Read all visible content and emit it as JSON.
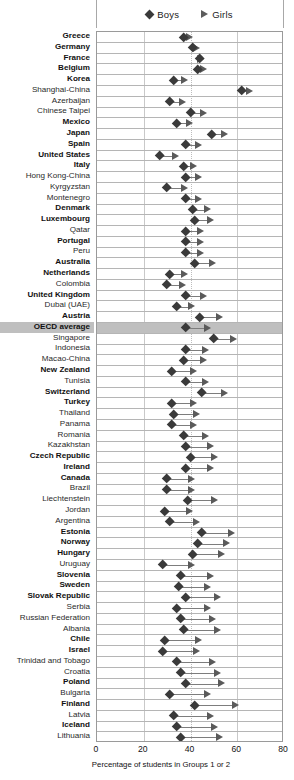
{
  "legend": {
    "boys": {
      "label": "Boys",
      "marker": "diamond-icon",
      "color": "#3a3a3a"
    },
    "girls": {
      "label": "Girls",
      "marker": "triangle-right-icon",
      "color": "#5a5a5a"
    }
  },
  "axis": {
    "xlabel": "Percentage of students in Groups 1 or 2",
    "ticks": [
      "0",
      "20",
      "40",
      "60",
      "80"
    ],
    "min": 0,
    "max": 80
  },
  "chart_data": {
    "type": "scatter",
    "title": "",
    "subtitle": "",
    "xlabel": "Percentage of students in Groups 1 or 2",
    "ylabel": "",
    "xlim": [
      0,
      80
    ],
    "grid": true,
    "legend_position": "top",
    "series": [
      {
        "name": "Boys",
        "marker": "diamond",
        "color": "#3a3a3a"
      },
      {
        "name": "Girls",
        "marker": "triangle-right",
        "color": "#5a5a5a"
      }
    ],
    "categories": [
      "Greece",
      "Germany",
      "France",
      "Belgium",
      "Korea",
      "Shanghai-China",
      "Azerbaijan",
      "Chinese Taipei",
      "Mexico",
      "Japan",
      "Spain",
      "United States",
      "Italy",
      "Hong Kong-China",
      "Kyrgyzstan",
      "Montenegro",
      "Denmark",
      "Luxembourg",
      "Qatar",
      "Portugal",
      "Peru",
      "Australia",
      "Netherlands",
      "Colombia",
      "United Kingdom",
      "Dubai (UAE)",
      "Austria",
      "OECD average",
      "Singapore",
      "Indonesia",
      "Macao-China",
      "New Zealand",
      "Tunisia",
      "Switzerland",
      "Turkey",
      "Thailand",
      "Panama",
      "Romania",
      "Kazakhstan",
      "Czech Republic",
      "Ireland",
      "Canada",
      "Brazil",
      "Liechtenstein",
      "Jordan",
      "Argentina",
      "Estonia",
      "Norway",
      "Hungary",
      "Uruguay",
      "Slovenia",
      "Sweden",
      "Slovak Republic",
      "Serbia",
      "Russian Federation",
      "Albania",
      "Chile",
      "Israel",
      "Trinidad and Tobago",
      "Croatia",
      "Poland",
      "Bulgaria",
      "Finland",
      "Latvia",
      "Iceland",
      "Lithuania"
    ],
    "rows": [
      {
        "label": "Greece",
        "bold": true,
        "highlight": false,
        "boys": 37,
        "girls": 39
      },
      {
        "label": "Germany",
        "bold": true,
        "highlight": false,
        "boys": 41,
        "girls": 42
      },
      {
        "label": "France",
        "bold": true,
        "highlight": false,
        "boys": 44,
        "girls": 44
      },
      {
        "label": "Belgium",
        "bold": true,
        "highlight": false,
        "boys": 43,
        "girls": 45
      },
      {
        "label": "Korea",
        "bold": true,
        "highlight": false,
        "boys": 33,
        "girls": 37
      },
      {
        "label": "Shanghai-China",
        "bold": false,
        "highlight": false,
        "boys": 62,
        "girls": 65
      },
      {
        "label": "Azerbaijan",
        "bold": false,
        "highlight": false,
        "boys": 31,
        "girls": 36
      },
      {
        "label": "Chinese Taipei",
        "bold": false,
        "highlight": false,
        "boys": 40,
        "girls": 45
      },
      {
        "label": "Mexico",
        "bold": true,
        "highlight": false,
        "boys": 34,
        "girls": 39
      },
      {
        "label": "Japan",
        "bold": true,
        "highlight": false,
        "boys": 49,
        "girls": 54
      },
      {
        "label": "Spain",
        "bold": true,
        "highlight": false,
        "boys": 38,
        "girls": 43
      },
      {
        "label": "United States",
        "bold": true,
        "highlight": false,
        "boys": 27,
        "girls": 33
      },
      {
        "label": "Italy",
        "bold": true,
        "highlight": false,
        "boys": 37,
        "girls": 41
      },
      {
        "label": "Hong Kong-China",
        "bold": false,
        "highlight": false,
        "boys": 38,
        "girls": 43
      },
      {
        "label": "Kyrgyzstan",
        "bold": false,
        "highlight": false,
        "boys": 30,
        "girls": 37
      },
      {
        "label": "Montenegro",
        "bold": false,
        "highlight": false,
        "boys": 38,
        "girls": 43
      },
      {
        "label": "Denmark",
        "bold": true,
        "highlight": false,
        "boys": 41,
        "girls": 47
      },
      {
        "label": "Luxembourg",
        "bold": true,
        "highlight": false,
        "boys": 42,
        "girls": 48
      },
      {
        "label": "Qatar",
        "bold": false,
        "highlight": false,
        "boys": 38,
        "girls": 44
      },
      {
        "label": "Portugal",
        "bold": true,
        "highlight": false,
        "boys": 38,
        "girls": 44
      },
      {
        "label": "Peru",
        "bold": false,
        "highlight": false,
        "boys": 38,
        "girls": 44
      },
      {
        "label": "Australia",
        "bold": true,
        "highlight": false,
        "boys": 42,
        "girls": 49
      },
      {
        "label": "Netherlands",
        "bold": true,
        "highlight": false,
        "boys": 31,
        "girls": 37
      },
      {
        "label": "Colombia",
        "bold": false,
        "highlight": false,
        "boys": 30,
        "girls": 36
      },
      {
        "label": "United Kingdom",
        "bold": true,
        "highlight": false,
        "boys": 38,
        "girls": 45
      },
      {
        "label": "Dubai (UAE)",
        "bold": false,
        "highlight": false,
        "boys": 34,
        "girls": 40
      },
      {
        "label": "Austria",
        "bold": true,
        "highlight": false,
        "boys": 44,
        "girls": 52
      },
      {
        "label": "OECD average",
        "bold": true,
        "highlight": true,
        "boys": 38,
        "girls": 47
      },
      {
        "label": "Singapore",
        "bold": false,
        "highlight": false,
        "boys": 50,
        "girls": 58
      },
      {
        "label": "Indonesia",
        "bold": false,
        "highlight": false,
        "boys": 38,
        "girls": 46
      },
      {
        "label": "Macao-China",
        "bold": false,
        "highlight": false,
        "boys": 37,
        "girls": 45
      },
      {
        "label": "New Zealand",
        "bold": true,
        "highlight": false,
        "boys": 32,
        "girls": 41
      },
      {
        "label": "Tunisia",
        "bold": false,
        "highlight": false,
        "boys": 38,
        "girls": 46
      },
      {
        "label": "Switzerland",
        "bold": true,
        "highlight": false,
        "boys": 45,
        "girls": 54
      },
      {
        "label": "Turkey",
        "bold": true,
        "highlight": false,
        "boys": 32,
        "girls": 41
      },
      {
        "label": "Thailand",
        "bold": false,
        "highlight": false,
        "boys": 33,
        "girls": 42
      },
      {
        "label": "Panama",
        "bold": false,
        "highlight": false,
        "boys": 32,
        "girls": 41
      },
      {
        "label": "Romania",
        "bold": false,
        "highlight": false,
        "boys": 37,
        "girls": 46
      },
      {
        "label": "Kazakhstan",
        "bold": false,
        "highlight": false,
        "boys": 38,
        "girls": 48
      },
      {
        "label": "Czech Republic",
        "bold": true,
        "highlight": false,
        "boys": 40,
        "girls": 50
      },
      {
        "label": "Ireland",
        "bold": true,
        "highlight": false,
        "boys": 38,
        "girls": 48
      },
      {
        "label": "Canada",
        "bold": true,
        "highlight": false,
        "boys": 30,
        "girls": 40
      },
      {
        "label": "Brazil",
        "bold": false,
        "highlight": false,
        "boys": 30,
        "girls": 40
      },
      {
        "label": "Liechtenstein",
        "bold": false,
        "highlight": false,
        "boys": 39,
        "girls": 50
      },
      {
        "label": "Jordan",
        "bold": false,
        "highlight": false,
        "boys": 29,
        "girls": 39
      },
      {
        "label": "Argentina",
        "bold": false,
        "highlight": false,
        "boys": 31,
        "girls": 42
      },
      {
        "label": "Estonia",
        "bold": true,
        "highlight": false,
        "boys": 45,
        "girls": 57
      },
      {
        "label": "Norway",
        "bold": true,
        "highlight": false,
        "boys": 43,
        "girls": 55
      },
      {
        "label": "Hungary",
        "bold": true,
        "highlight": false,
        "boys": 41,
        "girls": 53
      },
      {
        "label": "Uruguay",
        "bold": false,
        "highlight": false,
        "boys": 28,
        "girls": 40
      },
      {
        "label": "Slovenia",
        "bold": true,
        "highlight": false,
        "boys": 36,
        "girls": 48
      },
      {
        "label": "Sweden",
        "bold": true,
        "highlight": false,
        "boys": 35,
        "girls": 47
      },
      {
        "label": "Slovak Republic",
        "bold": true,
        "highlight": false,
        "boys": 38,
        "girls": 51
      },
      {
        "label": "Serbia",
        "bold": false,
        "highlight": false,
        "boys": 34,
        "girls": 47
      },
      {
        "label": "Russian Federation",
        "bold": false,
        "highlight": false,
        "boys": 36,
        "girls": 49
      },
      {
        "label": "Albania",
        "bold": false,
        "highlight": false,
        "boys": 37,
        "girls": 51
      },
      {
        "label": "Chile",
        "bold": true,
        "highlight": false,
        "boys": 29,
        "girls": 43
      },
      {
        "label": "Israel",
        "bold": true,
        "highlight": false,
        "boys": 28,
        "girls": 42
      },
      {
        "label": "Trinidad and Tobago",
        "bold": false,
        "highlight": false,
        "boys": 34,
        "girls": 49
      },
      {
        "label": "Croatia",
        "bold": false,
        "highlight": false,
        "boys": 36,
        "girls": 51
      },
      {
        "label": "Poland",
        "bold": true,
        "highlight": false,
        "boys": 38,
        "girls": 53
      },
      {
        "label": "Bulgaria",
        "bold": false,
        "highlight": false,
        "boys": 31,
        "girls": 47
      },
      {
        "label": "Finland",
        "bold": true,
        "highlight": false,
        "boys": 42,
        "girls": 59
      },
      {
        "label": "Latvia",
        "bold": false,
        "highlight": false,
        "boys": 33,
        "girls": 48
      },
      {
        "label": "Iceland",
        "bold": true,
        "highlight": false,
        "boys": 34,
        "girls": 50
      },
      {
        "label": "Lithuania",
        "bold": false,
        "highlight": false,
        "boys": 36,
        "girls": 52
      }
    ]
  }
}
